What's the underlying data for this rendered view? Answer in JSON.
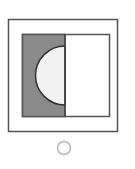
{
  "option": {
    "figure": {
      "outer_frame": "square-outline",
      "inner_frame": "rectangle-outline",
      "left_half": "gray-fill",
      "right_half": "white",
      "cutout": "light-semicircle-left-half"
    },
    "radio": {
      "selected": false
    },
    "colors": {
      "stroke": "#555555",
      "gray_fill": "#8a8a8a",
      "semicircle_fill": "#f2f2f2",
      "radio_stroke": "#b8b8b8",
      "background": "#ffffff"
    }
  }
}
